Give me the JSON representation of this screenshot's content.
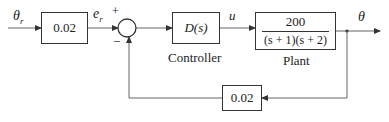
{
  "diagram": {
    "type": "block-diagram",
    "signals": {
      "reference": "θ",
      "reference_sub": "r",
      "error": "e",
      "error_sub": "r",
      "control": "u",
      "output": "θ"
    },
    "sum_junction": {
      "plus_sign": "+",
      "minus_sign": "−"
    },
    "blocks": {
      "input_gain": {
        "value": "0.02"
      },
      "controller": {
        "value": "D(s)",
        "caption": "Controller"
      },
      "plant": {
        "numerator": "200",
        "denominator": "(s + 1)(s + 2)",
        "caption": "Plant"
      },
      "feedback_gain": {
        "value": "0.02"
      }
    },
    "colors": {
      "line": "#555555",
      "block_border": "#333333",
      "text": "#222222"
    }
  }
}
